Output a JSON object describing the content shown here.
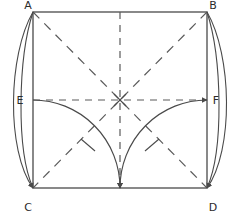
{
  "figure": {
    "stroke_color": "#4a4a4a",
    "label_color": "#2b2b2b",
    "background_color": "#ffffff",
    "square": {
      "left": 33,
      "top": 12,
      "right": 207,
      "bottom": 188,
      "side_px": 174
    },
    "center": {
      "x": 120,
      "y": 100,
      "marker": "x-cross"
    },
    "labels": [
      {
        "id": "A",
        "text": "A",
        "x": 28,
        "y": 9,
        "corner": "top-left"
      },
      {
        "id": "B",
        "text": "B",
        "x": 213,
        "y": 9,
        "corner": "top-right"
      },
      {
        "id": "C",
        "text": "C",
        "x": 28,
        "y": 211,
        "corner": "bottom-left"
      },
      {
        "id": "D",
        "text": "D",
        "x": 213,
        "y": 211,
        "corner": "bottom-right"
      },
      {
        "id": "E",
        "text": "E",
        "x": 20,
        "y": 103,
        "corner": "left-midpoint"
      },
      {
        "id": "F",
        "text": "F",
        "x": 215,
        "y": 103,
        "corner": "right-midpoint"
      }
    ],
    "dashed_lines": [
      {
        "id": "diagonal-ad",
        "from": "A",
        "to": "D",
        "x1": 33,
        "y1": 12,
        "x2": 207,
        "y2": 188
      },
      {
        "id": "diagonal-bc",
        "from": "B",
        "to": "C",
        "x1": 207,
        "y1": 12,
        "x2": 33,
        "y2": 188
      },
      {
        "id": "midline-vertical",
        "x1": 120,
        "y1": 12,
        "x2": 120,
        "y2": 188
      },
      {
        "id": "midline-horizontal",
        "from": "E",
        "to": "F",
        "x1": 33,
        "y1": 100,
        "x2": 207,
        "y2": 100
      }
    ],
    "arcs": [
      {
        "id": "arc-e-to-bottom-center",
        "from": "E",
        "to": "bottom-midpoint",
        "tick": true,
        "arrow": true
      },
      {
        "id": "arc-f-to-bottom-center",
        "from": "F",
        "to": "bottom-midpoint",
        "tick": true,
        "arrow": true
      },
      {
        "id": "arc-a-to-c-outer",
        "from": "A",
        "to": "C",
        "tick": false,
        "arrow": true
      },
      {
        "id": "arc-a-to-c-inner",
        "from": "A",
        "to": "C",
        "tick": false,
        "arrow": true
      },
      {
        "id": "arc-b-to-d-outer",
        "from": "B",
        "to": "D",
        "tick": false,
        "arrow": true
      },
      {
        "id": "arc-b-to-d-inner",
        "from": "B",
        "to": "D",
        "tick": false,
        "arrow": true
      }
    ],
    "arrow_targets": [
      {
        "id": "arrowhead-at-c",
        "x": 33,
        "y": 188
      },
      {
        "id": "arrowhead-at-d",
        "x": 207,
        "y": 188
      },
      {
        "id": "arrowhead-at-bottom-center",
        "x": 120,
        "y": 188
      },
      {
        "id": "arrowhead-at-f",
        "x": 207,
        "y": 100
      }
    ]
  }
}
